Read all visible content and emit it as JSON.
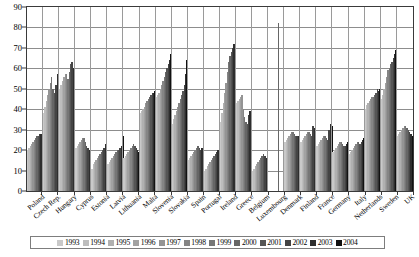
{
  "chart_data": {
    "type": "bar",
    "title": "",
    "subtitle": "",
    "xlabel": "",
    "ylabel": "",
    "ylim": [
      0,
      90
    ],
    "ytick_step": 10,
    "yticks": [
      0,
      10,
      20,
      30,
      40,
      50,
      60,
      70,
      80,
      90
    ],
    "grid": true,
    "legend_position": "bottom",
    "categories": [
      "Poland",
      "Czech Rep.",
      "Hungary",
      "Cyprus",
      "Estonia",
      "Latvia",
      "Lithuania",
      "Malta",
      "Slovenia",
      "Slovakia",
      "Spain",
      "Portugal",
      "Ireland",
      "Greece",
      "Belgium",
      "Luxembourg",
      "Denmark",
      "Finland",
      "France",
      "Germany",
      "Italy",
      "Netherlands",
      "Sweden",
      "UK"
    ],
    "series": [
      {
        "name": "1993",
        "color": "#c9c9c9",
        "values": [
          20,
          38,
          50,
          21,
          11,
          13,
          16,
          38,
          46,
          33,
          15,
          10,
          34,
          43,
          10,
          0,
          24,
          24,
          22,
          19,
          18,
          40,
          45,
          27
        ]
      },
      {
        "name": "1994",
        "color": "#bdbdbd",
        "values": [
          21,
          41,
          52,
          22,
          13,
          14,
          17,
          39,
          47,
          35,
          16,
          11,
          38,
          44,
          11,
          0,
          25,
          25,
          23,
          20,
          19,
          42,
          47,
          28
        ]
      },
      {
        "name": "1995",
        "color": "#b0b0b0",
        "values": [
          22,
          44,
          54,
          23,
          14,
          15,
          18,
          40,
          48,
          37,
          17,
          12,
          43,
          45,
          12,
          0,
          26,
          26,
          24,
          21,
          20,
          43,
          50,
          29
        ]
      },
      {
        "name": "1996",
        "color": "#a2a2a2",
        "values": [
          23,
          47,
          56,
          24,
          15,
          16,
          19,
          41,
          50,
          39,
          18,
          13,
          48,
          46,
          13,
          0,
          27,
          27,
          25,
          22,
          21,
          44,
          53,
          30
        ]
      },
      {
        "name": "1997",
        "color": "#949494",
        "values": [
          24,
          50,
          57,
          25,
          16,
          17,
          20,
          43,
          52,
          41,
          19,
          14,
          53,
          47,
          14,
          0,
          28,
          28,
          26,
          23,
          22,
          45,
          56,
          31
        ]
      },
      {
        "name": "1998",
        "color": "#858585",
        "values": [
          25,
          53,
          57,
          26,
          17,
          18,
          21,
          44,
          54,
          43,
          20,
          15,
          58,
          40,
          15,
          0,
          29,
          29,
          27,
          24,
          23,
          46,
          59,
          32
        ]
      },
      {
        "name": "1999",
        "color": "#767676",
        "values": [
          26,
          56,
          55,
          26,
          18,
          19,
          22,
          45,
          56,
          45,
          21,
          16,
          63,
          36,
          16,
          0,
          29,
          29,
          27,
          24,
          24,
          46,
          60,
          32
        ]
      },
      {
        "name": "2000",
        "color": "#666666",
        "values": [
          27,
          50,
          58,
          24,
          19,
          20,
          23,
          46,
          58,
          47,
          22,
          17,
          66,
          34,
          17,
          82,
          28,
          28,
          26,
          23,
          24,
          47,
          62,
          31
        ]
      },
      {
        "name": "2001",
        "color": "#555555",
        "values": [
          27,
          48,
          62,
          22,
          20,
          20,
          22,
          47,
          60,
          49,
          21,
          18,
          68,
          33,
          18,
          0,
          27,
          27,
          25,
          22,
          23,
          48,
          63,
          30
        ]
      },
      {
        "name": "2002",
        "color": "#444444",
        "values": [
          28,
          52,
          63,
          21,
          21,
          21,
          21,
          48,
          62,
          52,
          20,
          19,
          70,
          37,
          17,
          0,
          27,
          32,
          30,
          22,
          24,
          50,
          65,
          29
        ]
      },
      {
        "name": "2003",
        "color": "#2e2e2e",
        "values": [
          28,
          57,
          60,
          20,
          23,
          22,
          20,
          48,
          64,
          57,
          21,
          20,
          72,
          39,
          16,
          0,
          27,
          31,
          33,
          23,
          25,
          49,
          67,
          28
        ]
      },
      {
        "name": "2004",
        "color": "#111111",
        "values": [
          34,
          62,
          64,
          20,
          25,
          27,
          19,
          49,
          67,
          64,
          22,
          21,
          74,
          41,
          15,
          0,
          26,
          30,
          32,
          24,
          26,
          50,
          69,
          27
        ]
      }
    ]
  }
}
